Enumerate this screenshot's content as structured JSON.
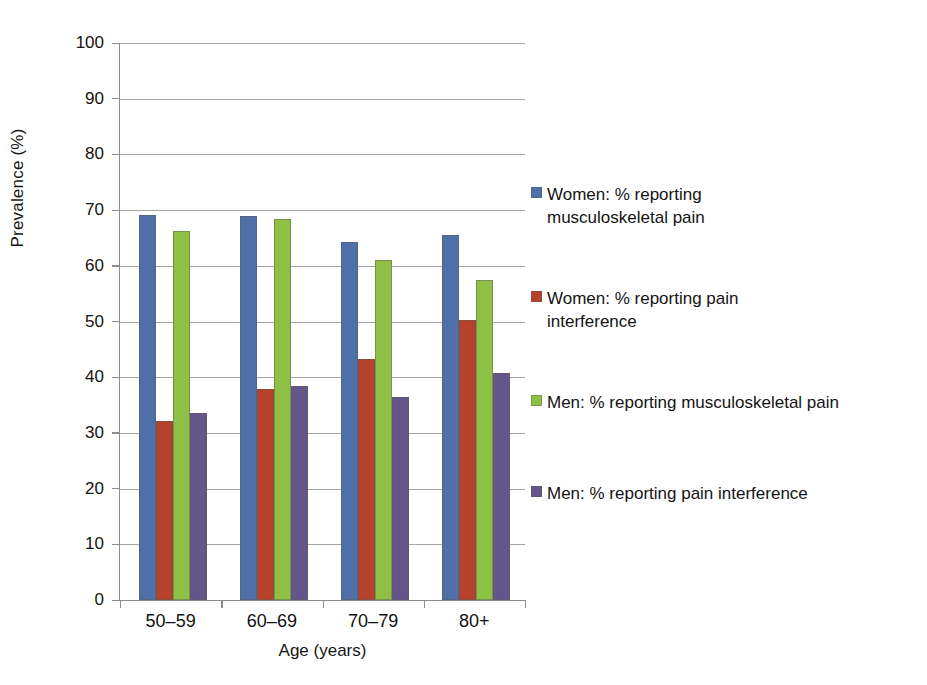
{
  "chart_data": {
    "type": "bar",
    "title": "",
    "xlabel": "Age (years)",
    "ylabel": "Prevalence (%)",
    "ylim": [
      0,
      100
    ],
    "ytick_step": 10,
    "yticks": [
      100,
      90,
      80,
      70,
      60,
      50,
      40,
      30,
      20,
      10,
      0
    ],
    "grid": "horizontal",
    "legend_position": "right",
    "categories": [
      "50–59",
      "60–69",
      "70–79",
      "80+"
    ],
    "series": [
      {
        "name": "Women: % reporting musculoskeletal pain",
        "color": "#4F6FA8",
        "values": [
          69.2,
          68.9,
          64.3,
          65.5
        ]
      },
      {
        "name": "Women: % reporting pain interference",
        "color": "#B5432C",
        "values": [
          32.1,
          37.9,
          43.3,
          50.2
        ]
      },
      {
        "name": "Men: % reporting musculoskeletal pain",
        "color": "#8DC044",
        "values": [
          66.3,
          68.4,
          61.0,
          57.5
        ]
      },
      {
        "name": "Men: % reporting pain interference",
        "color": "#64558B",
        "values": [
          33.5,
          38.4,
          36.4,
          40.8
        ]
      }
    ]
  },
  "axes": {
    "y_title": "Prevalence (%)",
    "x_title": "Age (years)",
    "y_tick_labels": [
      "100",
      "90",
      "80",
      "70",
      "60",
      "50",
      "40",
      "30",
      "20",
      "10",
      "0"
    ],
    "x_tick_labels": [
      "50–59",
      "60–69",
      "70–79",
      "80+"
    ]
  },
  "legend": {
    "items": [
      {
        "label": "Women: % reporting musculoskeletal pain",
        "color": "#4F6FA8"
      },
      {
        "label": "Women: % reporting pain interference",
        "color": "#B5432C"
      },
      {
        "label": "Men: % reporting musculoskeletal pain",
        "color": "#8DC044"
      },
      {
        "label": "Men: % reporting pain interference",
        "color": "#64558B"
      }
    ]
  }
}
